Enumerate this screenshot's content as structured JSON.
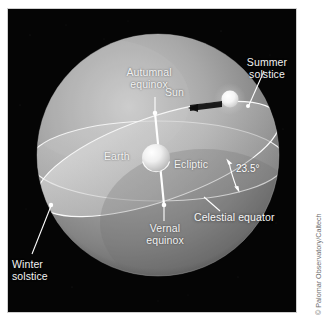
{
  "figure": {
    "title_alt": "Celestial sphere showing the ecliptic, celestial equator, equinoxes and solstices",
    "background_color": "#000000",
    "page_color": "#ffffff",
    "sphere_color": "#9a9a9a",
    "label_color": "#f2f2f2",
    "line_color": "#ffffff"
  },
  "labels": {
    "summer_solstice": "Summer\nsolstice",
    "autumnal_equinox": "Autumnal\nequinox",
    "sun": "Sun",
    "earth": "Earth",
    "ecliptic": "Ecliptic",
    "celestial_equator": "Celestial equator",
    "vernal_equinox": "Vernal\nequinox",
    "winter_solstice": "Winter\nsolstice",
    "tilt_angle": "23.5°"
  },
  "credit": {
    "text": "© Palomar Observatory/Caltech"
  },
  "diagram_data": {
    "type": "diagram",
    "subject": "celestial sphere",
    "obliquity_degrees": 23.5,
    "bodies": [
      {
        "name": "Earth",
        "role": "center of celestial sphere"
      },
      {
        "name": "Sun",
        "role": "on the ecliptic near summer solstice"
      }
    ],
    "great_circles": [
      {
        "name": "Ecliptic",
        "description": "apparent annual path of the Sun, tilted 23.5° to the celestial equator"
      },
      {
        "name": "Celestial equator",
        "description": "projection of Earth's equator onto the celestial sphere"
      }
    ],
    "marked_points": [
      {
        "name": "Vernal equinox",
        "type": "intersection of ecliptic and celestial equator"
      },
      {
        "name": "Autumnal equinox",
        "type": "intersection of ecliptic and celestial equator"
      },
      {
        "name": "Summer solstice",
        "type": "extreme point of ecliptic north of celestial equator"
      },
      {
        "name": "Winter solstice",
        "type": "extreme point of ecliptic south of celestial equator"
      }
    ]
  }
}
